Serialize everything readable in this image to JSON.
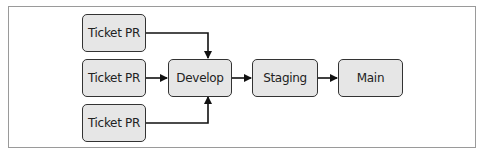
{
  "diagram": {
    "type": "flowchart",
    "direction": "left-to-right",
    "nodes": [
      {
        "id": "ticket1",
        "label": "Ticket PR"
      },
      {
        "id": "ticket2",
        "label": "Ticket PR"
      },
      {
        "id": "ticket3",
        "label": "Ticket PR"
      },
      {
        "id": "develop",
        "label": "Develop"
      },
      {
        "id": "staging",
        "label": "Staging"
      },
      {
        "id": "main",
        "label": "Main"
      }
    ],
    "edges": [
      {
        "from": "ticket1",
        "to": "develop"
      },
      {
        "from": "ticket2",
        "to": "develop"
      },
      {
        "from": "ticket3",
        "to": "develop"
      },
      {
        "from": "develop",
        "to": "staging"
      },
      {
        "from": "staging",
        "to": "main"
      }
    ],
    "colors": {
      "node_fill": "#e6e6e6",
      "node_border": "#333333",
      "edge": "#111111",
      "frame_border": "#9a9a9a"
    }
  }
}
